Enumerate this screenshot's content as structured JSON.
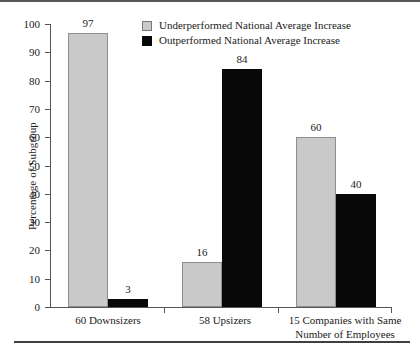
{
  "chart_data": {
    "type": "bar",
    "title": "",
    "xlabel": "",
    "ylabel": "Percentage of Subgroup",
    "ylim": [
      0,
      100
    ],
    "yticks": [
      0,
      10,
      20,
      30,
      40,
      50,
      60,
      70,
      80,
      90,
      100
    ],
    "grid": false,
    "legend_position": "top-center",
    "categories": [
      "60 Downsizers",
      "58 Upsizers",
      "15 Companies with Same\nNumber of Employees"
    ],
    "series": [
      {
        "name": "Underperformed National Average Increase",
        "color": "#c9c9c9",
        "values": [
          97,
          16,
          60
        ]
      },
      {
        "name": "Outperformed National Average Increase",
        "color": "#080808",
        "values": [
          3,
          84,
          40
        ]
      }
    ],
    "value_labels": [
      "97",
      "3",
      "16",
      "84",
      "60",
      "40"
    ]
  },
  "legend": {
    "items": [
      {
        "label": "Underperformed National Average Increase",
        "swatch": "gray"
      },
      {
        "label": "Outperformed National Average Increase",
        "swatch": "black"
      }
    ]
  },
  "axis": {
    "y_label": "Percentage of Subgroup",
    "y_tick_labels": [
      "100",
      "90",
      "80",
      "70",
      "60",
      "50",
      "40",
      "30",
      "20",
      "10",
      "0"
    ]
  },
  "groups": [
    {
      "label": "60 Downsizers",
      "bars": [
        {
          "value": "97",
          "series": "underperformed"
        },
        {
          "value": "3",
          "series": "outperformed"
        }
      ]
    },
    {
      "label": "58 Upsizers",
      "bars": [
        {
          "value": "16",
          "series": "underperformed"
        },
        {
          "value": "84",
          "series": "outperformed"
        }
      ]
    },
    {
      "label": "15 Companies with Same\nNumber of Employees",
      "bars": [
        {
          "value": "60",
          "series": "underperformed"
        },
        {
          "value": "40",
          "series": "outperformed"
        }
      ]
    }
  ]
}
